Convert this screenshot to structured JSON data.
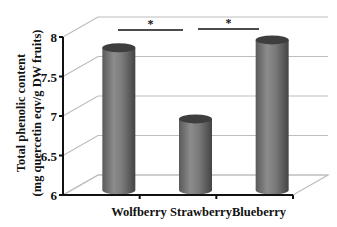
{
  "chart_data": {
    "type": "bar",
    "style": "3d-cylinder",
    "title": "",
    "xlabel": "",
    "ylabel": "Total phenolic content (mg quercetin eqv/g DW fruits)",
    "ylabel_lines": [
      "Total phenolic content",
      "(mg quercetin eqv/g DW fruits)"
    ],
    "categories": [
      "Wolfberry",
      "Strawberry",
      "Blueberry"
    ],
    "values": [
      7.8,
      6.9,
      7.9
    ],
    "ylim": [
      6,
      8
    ],
    "yticks": [
      6,
      6.5,
      7,
      7.5,
      8
    ],
    "ytick_labels": [
      "6",
      "6.5",
      "7",
      "7.5",
      "8"
    ],
    "grid": true,
    "legend": null,
    "annotations": [
      {
        "type": "significance-bracket",
        "from": "Wolfberry",
        "to": "Strawberry",
        "label": "*"
      },
      {
        "type": "significance-bracket",
        "from": "Strawberry",
        "to": "Blueberry",
        "label": "*"
      }
    ],
    "colors": {
      "bar": "#6e6e6e",
      "bar_light": "#9a9a9a",
      "bar_dark": "#3e3e3e",
      "grid": "#bdbdbd",
      "axis": "#111111"
    }
  }
}
